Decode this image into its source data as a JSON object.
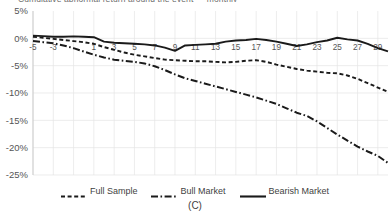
{
  "figure": {
    "clipped_title": "Cumulative abnormal return around the event — monthly",
    "panel_label": "(C)"
  },
  "legend": {
    "position": "bottom",
    "entries": [
      {
        "label": "Full Sample",
        "style": "dashed",
        "color": "#1a1a1a"
      },
      {
        "label": "Bull Market",
        "style": "dash-dot",
        "color": "#1a1a1a"
      },
      {
        "label": "Bearish Market",
        "style": "solid",
        "color": "#1a1a1a"
      }
    ]
  },
  "chart_data": {
    "type": "line",
    "title": "",
    "xlabel": "",
    "ylabel": "",
    "grid": true,
    "xlim": [
      -5,
      30
    ],
    "ylim": [
      -25,
      5
    ],
    "ytick_labels": [
      "5%",
      "0%",
      "-5%",
      "-10%",
      "-15%",
      "-20%",
      "-25%"
    ],
    "ytick_values": [
      5,
      0,
      -5,
      -10,
      -15,
      -20,
      -25
    ],
    "xtick_labels": [
      "-5",
      "-3",
      "1",
      "3",
      "5",
      "7",
      "9",
      "11",
      "13",
      "15",
      "17",
      "19",
      "21",
      "23",
      "25",
      "27",
      "29"
    ],
    "x": [
      -5,
      -4,
      -3,
      -2,
      -1,
      0,
      1,
      2,
      3,
      4,
      5,
      6,
      7,
      8,
      9,
      10,
      11,
      12,
      13,
      14,
      15,
      16,
      17,
      18,
      19,
      20,
      21,
      22,
      23,
      24,
      25,
      26,
      27,
      28,
      29,
      30
    ],
    "series": [
      {
        "name": "Full Sample",
        "style": "dashed",
        "color": "#1a1a1a",
        "values": [
          0.3,
          0.1,
          -0.1,
          -0.3,
          -0.5,
          -0.7,
          -1.0,
          -1.6,
          -2.1,
          -2.6,
          -3.0,
          -3.3,
          -3.6,
          -3.9,
          -4.0,
          -4.1,
          -4.2,
          -4.2,
          -4.3,
          -4.4,
          -4.3,
          -4.1,
          -4.0,
          -4.3,
          -4.8,
          -5.2,
          -5.6,
          -5.9,
          -6.1,
          -6.3,
          -6.4,
          -6.8,
          -7.4,
          -8.2,
          -9.0,
          -9.8
        ]
      },
      {
        "name": "Bull Market",
        "style": "dash-dot",
        "color": "#1a1a1a",
        "values": [
          -0.5,
          -0.7,
          -0.9,
          -1.3,
          -1.8,
          -2.4,
          -3.0,
          -3.5,
          -3.9,
          -4.1,
          -4.3,
          -4.6,
          -5.1,
          -5.8,
          -6.6,
          -7.3,
          -7.8,
          -8.3,
          -8.8,
          -9.3,
          -9.8,
          -10.3,
          -10.8,
          -11.4,
          -12.0,
          -12.8,
          -13.6,
          -14.2,
          -15.2,
          -16.4,
          -17.6,
          -18.7,
          -19.8,
          -20.7,
          -21.5,
          -22.8
        ]
      },
      {
        "name": "Bearish Market",
        "style": "solid",
        "color": "#1a1a1a",
        "values": [
          0.5,
          0.4,
          0.3,
          0.3,
          0.35,
          0.3,
          0.2,
          -0.6,
          -0.8,
          -0.9,
          -1.0,
          -1.1,
          -1.3,
          -1.7,
          -2.3,
          -1.3,
          -1.2,
          -1.1,
          -1.0,
          -0.6,
          -0.4,
          -0.3,
          -0.1,
          -0.3,
          -0.6,
          -1.0,
          -1.4,
          -1.1,
          -0.7,
          -0.4,
          0.1,
          -0.2,
          -0.4,
          -1.0,
          -1.8,
          -2.4
        ]
      }
    ]
  }
}
